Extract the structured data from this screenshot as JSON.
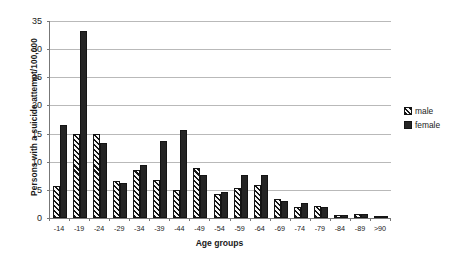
{
  "chart_data": {
    "type": "bar",
    "title": "",
    "xlabel": "Age groups",
    "ylabel": "Persons with a suicide attempt/100,000",
    "categories": [
      "-14",
      "-19",
      "-24",
      "-29",
      "-34",
      "-39",
      "-44",
      "-49",
      "-54",
      "-59",
      "-64",
      "-69",
      "-74",
      "-79",
      "-84",
      "-89",
      ">90"
    ],
    "series": [
      {
        "name": "male",
        "values": [
          5.7,
          15.0,
          15.0,
          6.5,
          8.6,
          6.7,
          4.9,
          8.9,
          4.3,
          5.4,
          5.9,
          3.3,
          1.9,
          2.1,
          0.5,
          0.7,
          0.4
        ]
      },
      {
        "name": "female",
        "values": [
          16.5,
          33.2,
          13.3,
          6.2,
          9.5,
          13.7,
          15.6,
          7.7,
          4.6,
          7.6,
          7.7,
          3.1,
          2.7,
          2.0,
          0.5,
          0.8,
          0.3
        ]
      }
    ],
    "ylim": [
      0,
      35
    ],
    "yticks": [
      0,
      5,
      10,
      15,
      20,
      25,
      30,
      35
    ],
    "ytick_labels": [
      "0",
      "5",
      "10",
      "15",
      "20",
      "25",
      "30",
      "35"
    ],
    "grid": true,
    "legend_position": "right",
    "colors": {
      "male": "#f2f2f2",
      "male_hatch": "#141414",
      "female": "#242424",
      "gridline": "#b9b9b9",
      "axis": "#777777",
      "text": "#1a1a1a",
      "background": "#ffffff"
    }
  },
  "legend": {
    "items": [
      {
        "label": "male",
        "key": "male"
      },
      {
        "label": "female",
        "key": "female"
      }
    ]
  }
}
